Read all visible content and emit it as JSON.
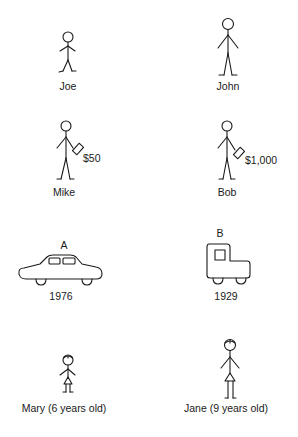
{
  "figures": {
    "row1": {
      "left": {
        "label": "Joe",
        "kind": "person-short"
      },
      "right": {
        "label": "John",
        "kind": "person-tall"
      }
    },
    "row2": {
      "left": {
        "label": "Mike",
        "amount": "$50",
        "kind": "person-with-wallet"
      },
      "right": {
        "label": "Bob",
        "amount": "$1,000",
        "kind": "person-with-wallet"
      }
    },
    "row3": {
      "left": {
        "letter": "A",
        "year": "1976",
        "kind": "modern-car"
      },
      "right": {
        "letter": "B",
        "year": "1929",
        "kind": "old-car"
      }
    },
    "row4": {
      "left": {
        "label": "Mary (6 years old)",
        "kind": "girl-short"
      },
      "right": {
        "label": "Jane (9 years old)",
        "kind": "girl-tall"
      }
    }
  }
}
